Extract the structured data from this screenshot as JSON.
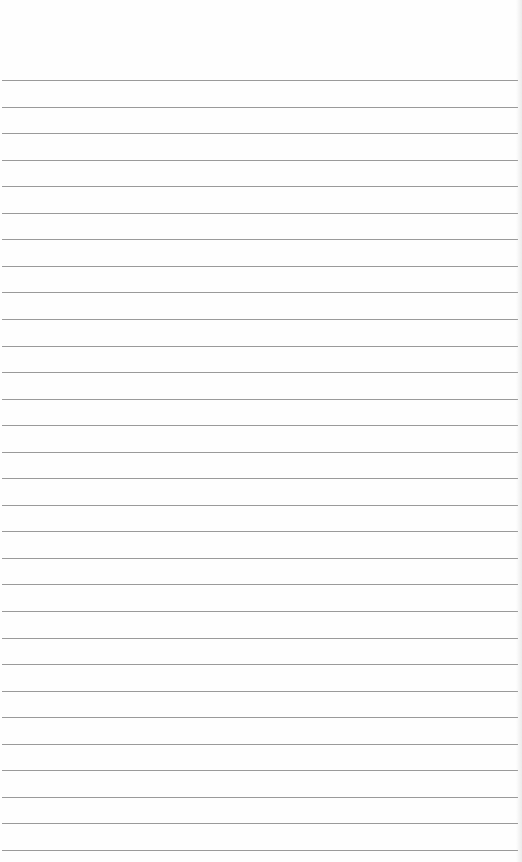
{
  "paper": {
    "type": "lined-paper",
    "line_count": 30,
    "first_line_y": 80,
    "line_spacing": 26.55,
    "line_color": "#9a9a9a",
    "background_color": "#fefefe"
  }
}
